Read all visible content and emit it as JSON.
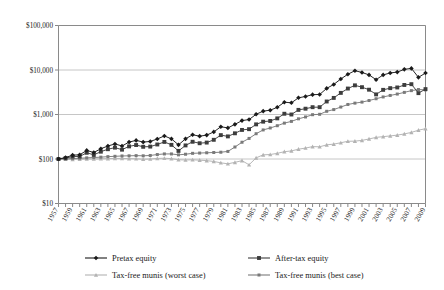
{
  "chart_data": {
    "type": "line",
    "title": "",
    "subtitle": "",
    "xlabel": "",
    "ylabel": "",
    "yscale": "log",
    "ylim": [
      10,
      100000
    ],
    "ytick_labels": [
      "$100,000",
      "$10,000",
      "$1,000",
      "$100",
      "$10"
    ],
    "ytick_values": [
      100000,
      10000,
      1000,
      100,
      10
    ],
    "grid": true,
    "legend_position": "bottom",
    "x": [
      1957,
      1958,
      1959,
      1960,
      1961,
      1962,
      1963,
      1964,
      1965,
      1966,
      1967,
      1968,
      1969,
      1970,
      1971,
      1972,
      1973,
      1974,
      1975,
      1976,
      1977,
      1978,
      1979,
      1980,
      1981,
      1982,
      1983,
      1984,
      1985,
      1986,
      1987,
      1988,
      1989,
      1990,
      1991,
      1992,
      1993,
      1994,
      1995,
      1996,
      1997,
      1998,
      1999,
      2000,
      2001,
      2002,
      2003,
      2004,
      2005,
      2006,
      2007,
      2008,
      2009
    ],
    "xtick_labels": [
      "1957",
      "1959",
      "1961",
      "1963",
      "1965",
      "1967",
      "1969",
      "1971",
      "1973",
      "1975",
      "1977",
      "1979",
      "1981",
      "1983",
      "1985",
      "1987",
      "1989",
      "1991",
      "1993",
      "1995",
      "1997",
      "1999",
      "2001",
      "2003",
      "2005",
      "2007",
      "2009"
    ],
    "xtick_values": [
      1957,
      1959,
      1961,
      1963,
      1965,
      1967,
      1969,
      1971,
      1973,
      1975,
      1977,
      1979,
      1981,
      1983,
      1985,
      1987,
      1989,
      1991,
      1993,
      1995,
      1997,
      1999,
      2001,
      2003,
      2005,
      2007,
      2009
    ],
    "series": [
      {
        "name": "Pretax equity",
        "color": "#1a1a1a",
        "marker": "diamond",
        "values": [
          100,
          108,
          122,
          124,
          156,
          140,
          170,
          196,
          218,
          196,
          240,
          262,
          240,
          248,
          282,
          330,
          284,
          208,
          284,
          350,
          326,
          344,
          406,
          530,
          500,
          600,
          730,
          770,
          1010,
          1190,
          1250,
          1450,
          1890,
          1830,
          2370,
          2540,
          2790,
          2820,
          3860,
          4740,
          6280,
          8020,
          9650,
          8810,
          7760,
          6060,
          7760,
          8580,
          8980,
          10340,
          10870,
          6840,
          8540
        ]
      },
      {
        "name": "After-tax equity",
        "color": "#3d3d3d",
        "marker": "square",
        "values": [
          100,
          104,
          114,
          114,
          138,
          124,
          146,
          166,
          180,
          162,
          192,
          206,
          188,
          190,
          212,
          242,
          208,
          152,
          202,
          244,
          226,
          234,
          270,
          344,
          322,
          378,
          450,
          468,
          600,
          690,
          716,
          818,
          1040,
          1000,
          1270,
          1350,
          1460,
          1460,
          1960,
          2360,
          3060,
          3830,
          4520,
          4110,
          3610,
          2830,
          3580,
          3910,
          4050,
          4610,
          4800,
          3020,
          3720
        ]
      },
      {
        "name": "Tax-free munis (worst case)",
        "color": "#b3b3b3",
        "marker": "triangle",
        "values": [
          100,
          99,
          98,
          99,
          100,
          100,
          101,
          102,
          103,
          103,
          102,
          101,
          99,
          100,
          103,
          104,
          102,
          96,
          95,
          96,
          94,
          92,
          88,
          82,
          78,
          84,
          92,
          74,
          106,
          124,
          126,
          134,
          146,
          152,
          166,
          176,
          190,
          188,
          208,
          216,
          232,
          250,
          252,
          262,
          282,
          306,
          318,
          330,
          344,
          366,
          396,
          444,
          480
        ]
      },
      {
        "name": "Tax-free munis (best case)",
        "color": "#7a7a7a",
        "marker": "square-small",
        "values": [
          100,
          101,
          102,
          104,
          106,
          108,
          110,
          113,
          115,
          117,
          118,
          119,
          118,
          120,
          126,
          130,
          130,
          124,
          128,
          134,
          136,
          138,
          140,
          142,
          148,
          186,
          238,
          290,
          370,
          450,
          498,
          560,
          640,
          700,
          800,
          880,
          990,
          1010,
          1180,
          1290,
          1470,
          1680,
          1800,
          1900,
          2060,
          2260,
          2480,
          2680,
          2880,
          3140,
          3440,
          3640,
          3580
        ]
      }
    ]
  },
  "legend": {
    "items": [
      {
        "label": "Pretax equity",
        "color": "#1a1a1a",
        "marker": "diamond"
      },
      {
        "label": "After-tax equity",
        "color": "#3d3d3d",
        "marker": "square"
      },
      {
        "label": "Tax-free munis (worst case)",
        "color": "#b3b3b3",
        "marker": "triangle"
      },
      {
        "label": "Tax-free munis (best case)",
        "color": "#7a7a7a",
        "marker": "square-small"
      }
    ]
  }
}
